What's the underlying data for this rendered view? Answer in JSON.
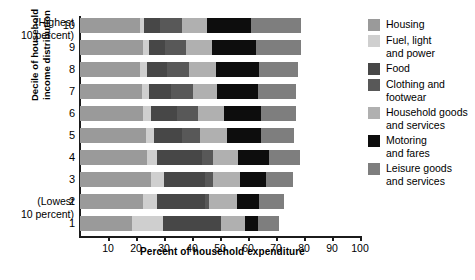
{
  "chart_data": {
    "type": "bar",
    "orientation": "horizontal",
    "stacked": true,
    "title": "",
    "xlabel": "Percent of household expenditure",
    "ylabel": "Decile of household income distribution",
    "xlim": [
      0,
      100
    ],
    "xticks": [
      10,
      20,
      30,
      40,
      50,
      60,
      70,
      80,
      90,
      100
    ],
    "grid": false,
    "legend_position": "right",
    "categories": [
      "1",
      "2",
      "3",
      "4",
      "5",
      "6",
      "7",
      "8",
      "9",
      "10"
    ],
    "series": [
      {
        "name": "Housing",
        "color": "#9a9a9a",
        "values": [
          18.5,
          22.5,
          25.5,
          24.0,
          23.5,
          22.5,
          22.0,
          21.5,
          22.5,
          21.5
        ]
      },
      {
        "name": "Fuel, light and power",
        "color": "#cfcfcf",
        "values": [
          11.0,
          5.0,
          4.5,
          3.5,
          3.0,
          3.0,
          2.5,
          2.5,
          2.0,
          1.5
        ]
      },
      {
        "name": "Food",
        "color": "#474747",
        "values": [
          21.0,
          17.0,
          14.5,
          16.0,
          10.0,
          9.0,
          8.0,
          7.0,
          6.0,
          5.5
        ]
      },
      {
        "name": "Clothing and footwear",
        "color": "#585858",
        "values": [
          0.0,
          1.5,
          3.0,
          4.0,
          6.5,
          7.5,
          8.0,
          8.0,
          7.5,
          8.0
        ]
      },
      {
        "name": "Household goods and services",
        "color": "#b0b0b0",
        "values": [
          8.5,
          10.0,
          9.5,
          9.0,
          9.5,
          9.5,
          8.5,
          9.5,
          9.0,
          9.0
        ]
      },
      {
        "name": "Motoring and fares",
        "color": "#0d0d0d",
        "values": [
          4.5,
          8.0,
          9.5,
          11.0,
          12.0,
          13.0,
          14.5,
          15.5,
          16.0,
          15.5
        ]
      },
      {
        "name": "Leisure goods and services",
        "color": "#7e7e7e",
        "values": [
          7.5,
          9.0,
          9.5,
          11.0,
          12.0,
          12.5,
          13.5,
          14.0,
          16.0,
          18.0
        ]
      }
    ],
    "row_totals": [
      71.0,
      73.0,
      76.0,
      78.5,
      76.5,
      77.0,
      77.0,
      78.0,
      79.0,
      79.0
    ],
    "annotations": {
      "top_note": "(Highest\n10 percent)",
      "bottom_note": "(Lowest\n10 percent)"
    }
  },
  "axis": {
    "x_title": "Percent of household expenditure",
    "y_title_line1": "Decile of household",
    "y_title_line2": "income distribution",
    "tick_labels": [
      "10",
      "20",
      "30",
      "40",
      "50",
      "60",
      "70",
      "80",
      "90",
      "100"
    ]
  },
  "notes": {
    "highest_line1": "(Highest",
    "highest_line2": "10 percent)",
    "lowest_line1": "(Lowest",
    "lowest_line2": "10 percent)"
  },
  "row_labels": [
    "10",
    "9",
    "8",
    "7",
    "6",
    "5",
    "4",
    "3",
    "2",
    "1"
  ],
  "legend": {
    "items": [
      {
        "label": "Housing",
        "color": "#9a9a9a"
      },
      {
        "label": "Fuel, light\nand power",
        "color": "#cfcfcf"
      },
      {
        "label": "Food",
        "color": "#474747"
      },
      {
        "label": "Clothing and\nfootwear",
        "color": "#585858"
      },
      {
        "label": "Household goods\nand services",
        "color": "#b0b0b0"
      },
      {
        "label": "Motoring\nand fares",
        "color": "#0d0d0d"
      },
      {
        "label": "Leisure goods\nand services",
        "color": "#7e7e7e"
      }
    ]
  }
}
